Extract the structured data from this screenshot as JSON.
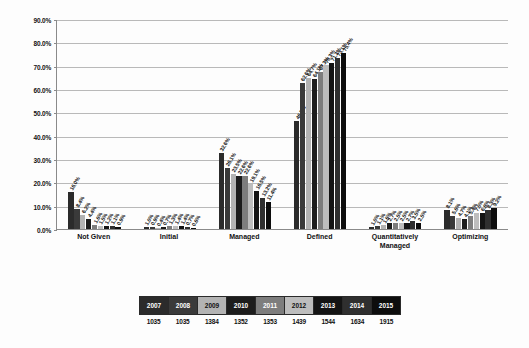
{
  "chart_data": {
    "type": "bar",
    "title": "",
    "xlabel": "",
    "ylabel": "",
    "ylim": [
      0,
      90
    ],
    "ytick_labels": [
      "0.0%",
      "10.0%",
      "20.0%",
      "30.0%",
      "40.0%",
      "50.0%",
      "60.0%",
      "70.0%",
      "80.0%",
      "90.0%"
    ],
    "ytick_values": [
      0,
      10,
      20,
      30,
      40,
      50,
      60,
      70,
      80,
      90
    ],
    "grid": true,
    "legend_position": "bottom",
    "categories": [
      "Not Given",
      "Initial",
      "Managed",
      "Defined",
      "Quantitatively Managed",
      "Optimizing"
    ],
    "series": [
      {
        "name": "2007",
        "count": "1035",
        "color": "#2b2b2b",
        "values": [
          16.0,
          1.0,
          32.6,
          46.5,
          1.0,
          8.1
        ],
        "labels": [
          "16.0%",
          "1.0%",
          "32.6%",
          "46.5%",
          "1.0%",
          "8.1%"
        ]
      },
      {
        "name": "2008",
        "count": "1035",
        "color": "#3a3a3a",
        "values": [
          8.4,
          0.9,
          26.1,
          62.6,
          1.1,
          5.6
        ],
        "labels": [
          "8.4%",
          "0.9%",
          "26.1%",
          "62.6%",
          "1.1%",
          "5.6%"
        ]
      },
      {
        "name": "2009",
        "count": "1384",
        "color": "#b3b3b3",
        "values": [
          6.2,
          0.4,
          23.5,
          64.7,
          1.6,
          4.7
        ],
        "labels": [
          "6.2%",
          "0.4%",
          "23.5%",
          "64.7%",
          "1.6%",
          "4.7%"
        ]
      },
      {
        "name": "2010",
        "count": "1352",
        "color": "#1c1c1c",
        "values": [
          4.4,
          0.7,
          22.6,
          64.1,
          2.7,
          4.1
        ],
        "labels": [
          "4.4%",
          "0.7%",
          "22.6%",
          "64.1%",
          "2.7%",
          "4.1%"
        ]
      },
      {
        "name": "2011",
        "count": "1353",
        "color": "#7d7d7d",
        "values": [
          1.6,
          1.3,
          22.6,
          67.3,
          2.5,
          5.4
        ],
        "labels": [
          "1.6%",
          "1.3%",
          "22.6%",
          "67.3%",
          "2.5%",
          "5.4%"
        ]
      },
      {
        "name": "2012",
        "count": "1439",
        "color": "#bdbdbd",
        "values": [
          1.5,
          1.4,
          19.1,
          70.3,
          2.5,
          7.0
        ],
        "labels": [
          "1.5%",
          "1.4%",
          "19.1%",
          "70.3%",
          "2.5%",
          "7.0%"
        ]
      },
      {
        "name": "2013",
        "count": "1544",
        "color": "#141414",
        "values": [
          1.2,
          1.4,
          16.5,
          71.3,
          2.7,
          6.8
        ],
        "labels": [
          "1.2%",
          "1.4%",
          "16.5%",
          "71.3%",
          "2.7%",
          "6.8%"
        ]
      },
      {
        "name": "2014",
        "count": "1634",
        "color": "#2f2f2f",
        "values": [
          1.1,
          0.7,
          13.2,
          73.1,
          3.5,
          8.3
        ],
        "labels": [
          "1.1%",
          "0.7%",
          "13.2%",
          "73.1%",
          "3.5%",
          "8.3%"
        ]
      },
      {
        "name": "2015",
        "count": "1915",
        "color": "#0d0d0d",
        "values": [
          0.9,
          0.6,
          11.4,
          75.4,
          2.5,
          9.2
        ],
        "labels": [
          "0.9%",
          "0.6%",
          "11.4%",
          "75.4%",
          "2.5%",
          "9.2%"
        ]
      }
    ]
  },
  "legend": {
    "swatch_text_color_light": "#ffffff",
    "swatch_text_color_dark": "#111111"
  }
}
